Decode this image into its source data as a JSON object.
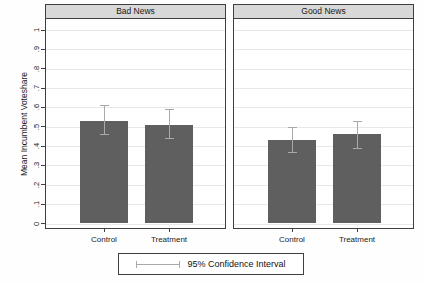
{
  "figure": {
    "background": "#ffffff"
  },
  "colors": {
    "bar": "#5f5f5f",
    "ci": "#a9a9a9",
    "grid": "#e8e8e8",
    "border": "#3f3f3f",
    "header_fill": "#d8d8d8",
    "text": "#1a1a1a"
  },
  "y_axis": {
    "title": "Mean Incumbent Voteshare",
    "ticks": [
      "0",
      ".1",
      ".2",
      ".3",
      ".4",
      ".5",
      ".6",
      ".7",
      ".8",
      ".9",
      "1"
    ],
    "tick_values": [
      0,
      0.1,
      0.2,
      0.3,
      0.4,
      0.5,
      0.6,
      0.7,
      0.8,
      0.9,
      1
    ]
  },
  "legend": {
    "symbol": "error-bar",
    "label": "95% Confidence Interval"
  },
  "chart_data": {
    "type": "bar",
    "layout": "two-panel small multiples, shared y axis, horizontal gridlines on, legend boxed bottom center",
    "ylabel": "Mean Incumbent Voteshare",
    "ylim": [
      0,
      1
    ],
    "grid": true,
    "categories": [
      "Control",
      "Treatment"
    ],
    "panels": [
      {
        "title": "Bad News",
        "categories": [
          "Control",
          "Treatment"
        ],
        "values": [
          0.53,
          0.51
        ],
        "ci_low": [
          0.46,
          0.44
        ],
        "ci_high": [
          0.61,
          0.59
        ]
      },
      {
        "title": "Good News",
        "categories": [
          "Control",
          "Treatment"
        ],
        "values": [
          0.43,
          0.46
        ],
        "ci_low": [
          0.37,
          0.39
        ],
        "ci_high": [
          0.5,
          0.53
        ]
      }
    ],
    "legend": "95% Confidence Interval"
  }
}
